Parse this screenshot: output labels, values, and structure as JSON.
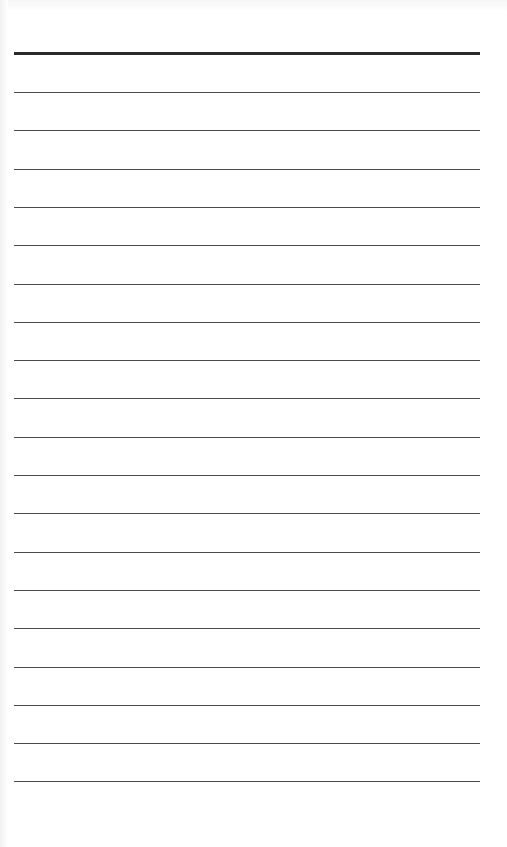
{
  "page": {
    "type": "lined-paper",
    "header_rule": {
      "y": 52,
      "thickness": 3,
      "color": "#2a2a2a"
    },
    "rules": {
      "count": 19,
      "first_y": 92,
      "spacing": 38.3,
      "x_start": 14,
      "x_end": 480,
      "color": "#4a4a4a"
    },
    "background": "#ffffff"
  }
}
